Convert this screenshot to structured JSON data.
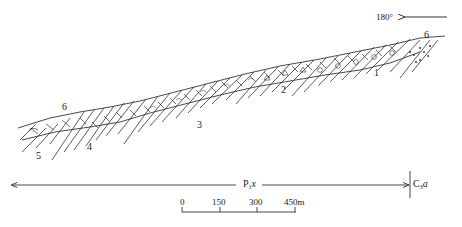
{
  "diagram": {
    "type": "geological-cross-section",
    "orientation": {
      "label": "180°",
      "arrow_direction": "left"
    },
    "layers": [
      {
        "id": "1",
        "label": "1",
        "lithology": "limestone-with-oolites"
      },
      {
        "id": "2",
        "label": "2",
        "lithology": "limestone-with-triangle-clasts"
      },
      {
        "id": "3",
        "label": "3",
        "lithology": "dolomitic-limestone-with-chert"
      },
      {
        "id": "4",
        "label": "4",
        "lithology": "thin-bedded-limestone"
      },
      {
        "id": "5",
        "label": "5",
        "lithology": "limestone-with-fossil"
      }
    ],
    "fossil_symbols": [
      {
        "name": "snail-fossil-left",
        "glyph": "6"
      },
      {
        "name": "snail-fossil-right",
        "glyph": "6"
      }
    ],
    "formations": {
      "left": {
        "base": "P",
        "sub": "1",
        "suffix": "x"
      },
      "right": {
        "base": "C",
        "sub": "3",
        "suffix": "a"
      }
    },
    "scale_bar": {
      "ticks": [
        "0",
        "150",
        "300",
        "450m"
      ]
    }
  }
}
